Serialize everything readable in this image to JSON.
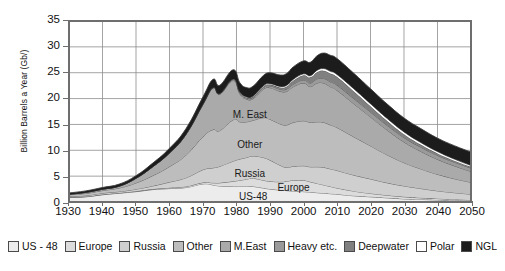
{
  "chart_data": {
    "type": "area",
    "title": "",
    "subtitle": "",
    "xlabel": "",
    "ylabel": "Billion Barrels a Year (Gb/)",
    "xlim": [
      1930,
      2050
    ],
    "ylim": [
      0,
      35
    ],
    "grid": true,
    "stacked": true,
    "legend_position": "bottom",
    "xticks": [
      1930,
      1940,
      1950,
      1960,
      1970,
      1980,
      1990,
      2000,
      2010,
      2020,
      2030,
      2040,
      2050
    ],
    "yticks": [
      0,
      5,
      10,
      15,
      20,
      25,
      30,
      35
    ],
    "x": [
      1930,
      1935,
      1940,
      1945,
      1950,
      1955,
      1960,
      1965,
      1970,
      1973,
      1975,
      1979,
      1981,
      1983,
      1985,
      1988,
      1990,
      1993,
      1995,
      1997,
      2000,
      2002,
      2004,
      2006,
      2008,
      2010,
      2015,
      2020,
      2025,
      2030,
      2035,
      2040,
      2045,
      2050
    ],
    "series": [
      {
        "name": "US - 48",
        "color": "#ececec",
        "values": [
          0.9,
          1.0,
          1.4,
          1.7,
          2.0,
          2.4,
          2.6,
          2.8,
          3.5,
          3.3,
          3.1,
          3.0,
          3.0,
          3.0,
          3.0,
          2.7,
          2.5,
          2.3,
          2.2,
          2.1,
          2.0,
          1.9,
          1.8,
          1.7,
          1.6,
          1.5,
          1.2,
          1.0,
          0.8,
          0.6,
          0.5,
          0.4,
          0.3,
          0.25
        ]
      },
      {
        "name": "Europe",
        "color": "#dcdcdc",
        "values": [
          0.05,
          0.05,
          0.06,
          0.06,
          0.08,
          0.1,
          0.15,
          0.2,
          0.25,
          0.4,
          0.6,
          1.0,
          1.2,
          1.4,
          1.6,
          1.5,
          1.5,
          1.6,
          1.8,
          2.1,
          2.2,
          2.0,
          1.8,
          1.6,
          1.4,
          1.2,
          0.9,
          0.65,
          0.5,
          0.4,
          0.3,
          0.25,
          0.2,
          0.15
        ]
      },
      {
        "name": "Russia",
        "color": "#cfcfcf",
        "values": [
          0.15,
          0.2,
          0.25,
          0.25,
          0.4,
          0.6,
          1.1,
          1.7,
          2.5,
          2.9,
          3.2,
          3.9,
          4.1,
          4.2,
          4.3,
          4.4,
          4.1,
          3.2,
          2.7,
          2.7,
          2.8,
          2.9,
          3.2,
          3.4,
          3.4,
          3.4,
          3.1,
          2.8,
          2.4,
          2.1,
          1.8,
          1.5,
          1.3,
          1.1
        ]
      },
      {
        "name": "Other",
        "color": "#bdbdbd",
        "values": [
          0.3,
          0.4,
          0.5,
          0.7,
          1.2,
          2.0,
          3.0,
          4.4,
          6.4,
          7.4,
          6.9,
          8.0,
          7.2,
          6.9,
          6.9,
          7.7,
          7.9,
          8.0,
          8.2,
          8.5,
          8.7,
          8.6,
          8.7,
          8.7,
          8.5,
          8.3,
          7.4,
          6.4,
          5.4,
          4.5,
          3.8,
          3.2,
          2.7,
          2.3
        ]
      },
      {
        "name": "M.East",
        "color": "#aaaaaa",
        "values": [
          0.1,
          0.2,
          0.25,
          0.35,
          0.9,
          1.7,
          2.6,
          4.0,
          6.2,
          8.0,
          7.0,
          7.6,
          5.4,
          4.4,
          4.2,
          5.5,
          6.1,
          6.3,
          6.5,
          6.9,
          7.3,
          6.9,
          7.5,
          7.6,
          7.4,
          7.2,
          6.4,
          5.6,
          4.8,
          4.0,
          3.4,
          2.9,
          2.5,
          2.1
        ]
      },
      {
        "name": "Heavy etc.",
        "color": "#9a9a9a",
        "values": [
          0.0,
          0.0,
          0.0,
          0.0,
          0.0,
          0.02,
          0.04,
          0.06,
          0.1,
          0.12,
          0.14,
          0.18,
          0.2,
          0.22,
          0.25,
          0.3,
          0.35,
          0.4,
          0.45,
          0.5,
          0.6,
          0.7,
          0.8,
          0.9,
          0.95,
          1.0,
          1.0,
          0.95,
          0.9,
          0.85,
          0.8,
          0.75,
          0.7,
          0.65
        ]
      },
      {
        "name": "Deepwater",
        "color": "#808080",
        "values": [
          0.0,
          0.0,
          0.0,
          0.0,
          0.0,
          0.0,
          0.0,
          0.0,
          0.0,
          0.0,
          0.02,
          0.05,
          0.08,
          0.1,
          0.15,
          0.2,
          0.25,
          0.35,
          0.5,
          0.7,
          0.9,
          1.1,
          1.3,
          1.5,
          1.6,
          1.6,
          1.4,
          1.1,
          0.85,
          0.65,
          0.5,
          0.4,
          0.3,
          0.25
        ]
      },
      {
        "name": "Polar",
        "color": "#ffffff",
        "values": [
          0.0,
          0.0,
          0.0,
          0.0,
          0.0,
          0.0,
          0.0,
          0.0,
          0.0,
          0.0,
          0.0,
          0.05,
          0.08,
          0.1,
          0.12,
          0.15,
          0.18,
          0.2,
          0.22,
          0.25,
          0.28,
          0.3,
          0.35,
          0.4,
          0.42,
          0.45,
          0.5,
          0.5,
          0.48,
          0.45,
          0.4,
          0.35,
          0.3,
          0.25
        ]
      },
      {
        "name": "NGL",
        "color": "#1c1c1c",
        "values": [
          0.25,
          0.3,
          0.35,
          0.4,
          0.5,
          0.7,
          0.9,
          1.1,
          1.4,
          1.6,
          1.6,
          1.8,
          1.8,
          1.8,
          1.9,
          2.0,
          2.1,
          2.2,
          2.3,
          2.4,
          2.5,
          2.6,
          2.8,
          3.0,
          3.1,
          3.1,
          3.0,
          2.9,
          2.8,
          2.7,
          2.7,
          2.6,
          2.6,
          2.6
        ]
      }
    ],
    "annotations": [
      {
        "label": "M. East",
        "x": 1984,
        "y": 16.8
      },
      {
        "label": "Other",
        "x": 1984,
        "y": 11.0
      },
      {
        "label": "Russia",
        "x": 1984,
        "y": 5.6
      },
      {
        "label": "US-48",
        "x": 1985,
        "y": 1.2
      },
      {
        "label": "Europe",
        "x": 1997,
        "y": 2.9
      }
    ]
  },
  "axis": {
    "ylabel": "Billion Barrels a Year (Gb/)",
    "yticks": [
      "35",
      "30",
      "25",
      "20",
      "15",
      "10",
      "5",
      "0"
    ],
    "xticks": [
      "1930",
      "1940",
      "1950",
      "1960",
      "1970",
      "1980",
      "1990",
      "2000",
      "2010",
      "2020",
      "2030",
      "2040",
      "2050"
    ]
  },
  "legend": {
    "items": [
      {
        "label": "US - 48",
        "color": "#ececec"
      },
      {
        "label": "Europe",
        "color": "#dcdcdc"
      },
      {
        "label": "Russia",
        "color": "#cfcfcf"
      },
      {
        "label": "Other",
        "color": "#bdbdbd"
      },
      {
        "label": "M.East",
        "color": "#aaaaaa"
      },
      {
        "label": "Heavy etc.",
        "color": "#9a9a9a"
      },
      {
        "label": "Deepwater",
        "color": "#808080"
      },
      {
        "label": "Polar",
        "color": "#ffffff"
      },
      {
        "label": "NGL",
        "color": "#1c1c1c"
      }
    ]
  },
  "colors": {
    "grid": "#8c8c8c",
    "axis": "#6e6e6e",
    "outline": "#3a3a3a",
    "text": "#111111",
    "background": "#ffffff"
  }
}
